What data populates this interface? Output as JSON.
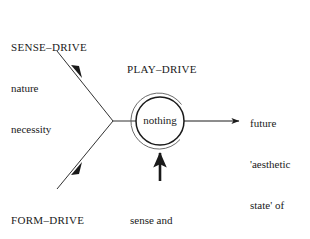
{
  "diagram": {
    "stroke_color": "#1a1a1a",
    "background_color": "#ffffff"
  },
  "nodes": {
    "sense_drive": {
      "heading": "SENSE–DRIVE",
      "line1": "nature",
      "line2": "necessity"
    },
    "form_drive": {
      "heading": "FORM–DRIVE",
      "line1": "reason",
      "line2": "freedom"
    },
    "play_drive": {
      "heading": "PLAY–DRIVE"
    },
    "center": {
      "label": "nothing"
    },
    "outcome": {
      "line1": "future",
      "line2": "'aesthetic",
      "line3": "state' of",
      "line4": "society"
    },
    "cancellation": {
      "line1": "sense and",
      "line2": "form–drive",
      "line3": "cancelled"
    }
  }
}
